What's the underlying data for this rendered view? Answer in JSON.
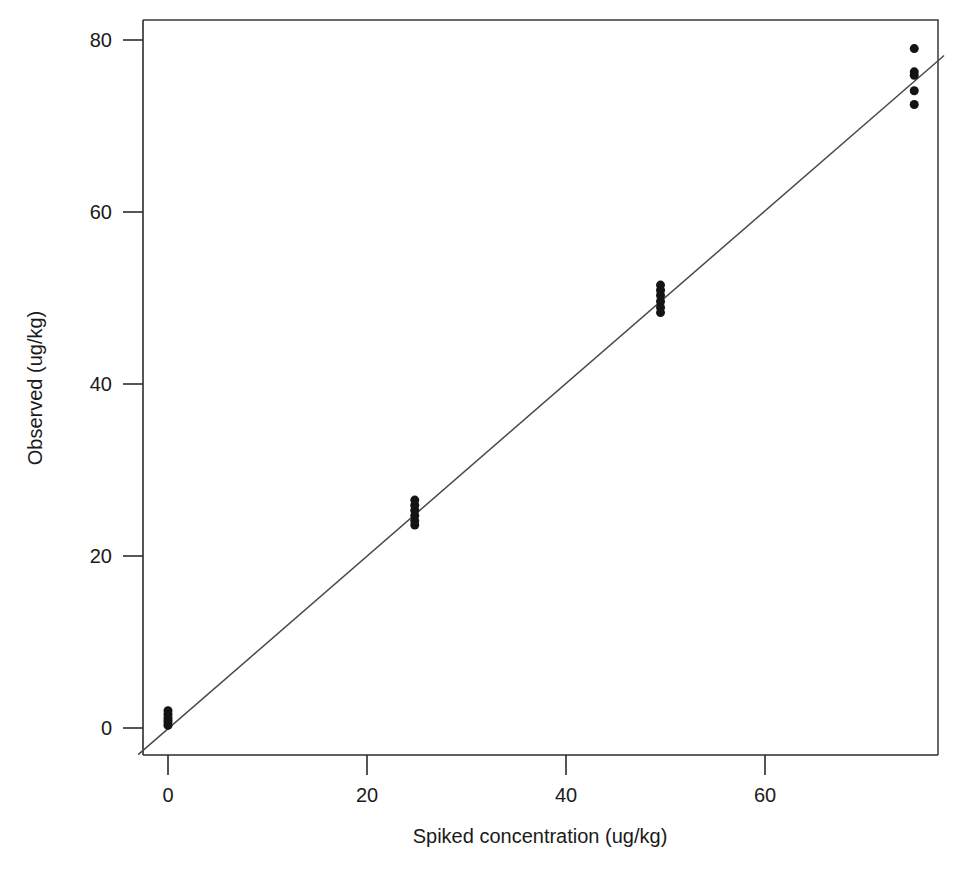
{
  "chart_data": {
    "type": "scatter",
    "title": "",
    "xlabel": "Spiked concentration (ug/kg)",
    "ylabel": "Observed (ug/kg)",
    "xlim": [
      -4,
      79
    ],
    "ylim": [
      -3,
      84
    ],
    "xticks": [
      0,
      20,
      40,
      60
    ],
    "yticks": [
      0,
      20,
      40,
      60,
      80
    ],
    "xticklabels": [
      "0",
      "20",
      "40",
      "60"
    ],
    "yticklabels": [
      "0",
      "20",
      "40",
      "60",
      "80"
    ],
    "grid": false,
    "legend": false,
    "legend_position": "none",
    "point_color": "#141414",
    "line_color": "#4a4a4a",
    "marker": "filled-circle",
    "marker_size_px": 9,
    "series": [
      {
        "name": "Observed vs spiked",
        "kind": "scatter",
        "points": [
          {
            "x": 0.0,
            "y": 0.3
          },
          {
            "x": 0.0,
            "y": 0.6
          },
          {
            "x": 0.0,
            "y": 0.9
          },
          {
            "x": 0.0,
            "y": 1.2
          },
          {
            "x": 0.0,
            "y": 1.6
          },
          {
            "x": 0.0,
            "y": 2.0
          },
          {
            "x": 24.8,
            "y": 23.6
          },
          {
            "x": 24.8,
            "y": 24.1
          },
          {
            "x": 24.8,
            "y": 24.7
          },
          {
            "x": 24.8,
            "y": 25.3
          },
          {
            "x": 24.8,
            "y": 25.9
          },
          {
            "x": 24.8,
            "y": 26.5
          },
          {
            "x": 49.5,
            "y": 48.3
          },
          {
            "x": 49.5,
            "y": 48.9
          },
          {
            "x": 49.5,
            "y": 49.6
          },
          {
            "x": 49.5,
            "y": 50.3
          },
          {
            "x": 49.5,
            "y": 50.9
          },
          {
            "x": 49.5,
            "y": 51.5
          },
          {
            "x": 75.0,
            "y": 72.5
          },
          {
            "x": 75.0,
            "y": 74.1
          },
          {
            "x": 75.0,
            "y": 75.9
          },
          {
            "x": 75.0,
            "y": 76.3
          },
          {
            "x": 75.0,
            "y": 79.0
          }
        ]
      },
      {
        "name": "Fitted line",
        "kind": "line",
        "x0": -3.0,
        "y0": -3.1,
        "x1": 78.0,
        "y1": 78.2,
        "slope": 1.004,
        "intercept": -0.09
      }
    ]
  },
  "axes": {
    "x_title": "Spiked concentration (ug/kg)",
    "y_title": "Observed (ug/kg)"
  }
}
